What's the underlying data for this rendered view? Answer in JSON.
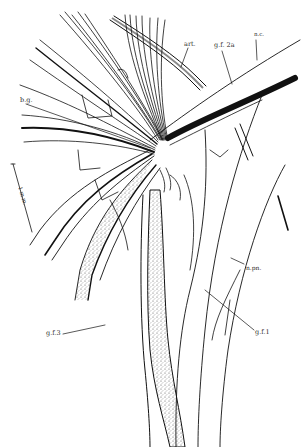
{
  "figure": {
    "type": "anatomical line drawing",
    "colors": {
      "ink": "#111111",
      "background": "#ffffff",
      "stipple": "#6a6a6a"
    },
    "labels": {
      "art": "art.",
      "gf2a": "g.f. 2a",
      "nc": "n.c.",
      "bg": "b.g.",
      "scale": "1 m.m.",
      "npn": "n.pn.",
      "gf1": "g.f.1",
      "gf3": "g.f.3"
    }
  }
}
